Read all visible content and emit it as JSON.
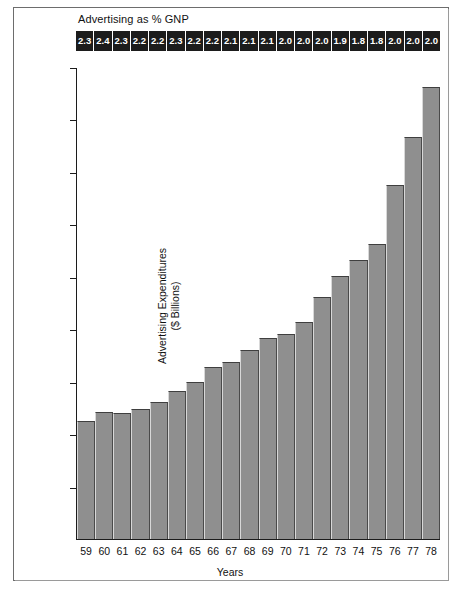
{
  "chart_data": {
    "type": "bar",
    "title": "",
    "xlabel": "Years",
    "ylabel": "Advertising Expenditures ($ Billions)",
    "ylim": [
      0,
      45
    ],
    "yticks": [
      5,
      10,
      15,
      20,
      25,
      30,
      35,
      40,
      45
    ],
    "grid": false,
    "legend": "none",
    "categories": [
      "59",
      "60",
      "61",
      "62",
      "63",
      "64",
      "65",
      "66",
      "67",
      "68",
      "69",
      "70",
      "71",
      "72",
      "73",
      "74",
      "75",
      "76",
      "77",
      "78"
    ],
    "values": [
      11.3,
      12.1,
      12.0,
      12.4,
      13.1,
      14.1,
      15.0,
      16.4,
      16.9,
      18.1,
      19.2,
      19.6,
      20.7,
      23.1,
      25.1,
      26.7,
      28.2,
      33.8,
      38.4,
      43.2
    ],
    "annotation_row": {
      "label": "Advertising as % GNP",
      "values": [
        "2.3",
        "2.4",
        "2.3",
        "2.2",
        "2.2",
        "2.3",
        "2.2",
        "2.2",
        "2.1",
        "2.1",
        "2.1",
        "2.0",
        "2.0",
        "2.0",
        "1.9",
        "1.8",
        "1.8",
        "2.0",
        "2.0",
        "2.0"
      ]
    },
    "colors": {
      "bar_fill": "#8f8f8f",
      "bar_edge": "#3f3f3f",
      "band_background": "#1c1c1c",
      "band_text": "#ffffff",
      "axis": "#1c1c1c",
      "page_background": "#ffffff"
    }
  },
  "ylabel_lines": {
    "line1": "Advertising Expenditures",
    "line2": "($ Billions)"
  }
}
